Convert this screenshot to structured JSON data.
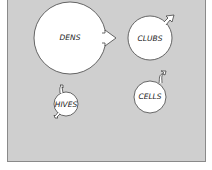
{
  "diagram": {
    "background": "#cfcfcf",
    "nodes": [
      {
        "id": "dens",
        "label": "DENS",
        "cx": 70,
        "cy": 38,
        "r": 36
      },
      {
        "id": "clubs",
        "label": "CLUBS",
        "cx": 150,
        "cy": 38,
        "r": 22
      },
      {
        "id": "hives",
        "label": "HIVES",
        "cx": 66,
        "cy": 104,
        "r": 12
      },
      {
        "id": "cells",
        "label": "CELLS",
        "cx": 150,
        "cy": 97,
        "r": 16
      }
    ],
    "arrows": [
      {
        "from": "dens",
        "to": "clubs",
        "style": "block-arrow"
      },
      {
        "from": "clubs",
        "to": "outside",
        "style": "small-arrow-up-right"
      },
      {
        "from": "cells",
        "to": "outside",
        "style": "small-hook-up"
      },
      {
        "from": "hives",
        "to": "outside",
        "style": "small-hooks"
      }
    ]
  }
}
